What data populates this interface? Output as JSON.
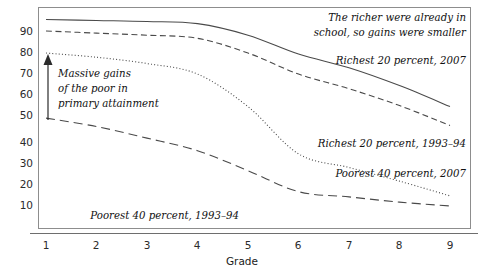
{
  "chart_data": {
    "type": "line",
    "title": "",
    "xlabel": "Grade",
    "ylabel": "",
    "x": [
      1,
      2,
      3,
      4,
      5,
      6,
      7,
      8,
      9
    ],
    "xlim": [
      0.6,
      9.4
    ],
    "ylim": [
      0,
      100
    ],
    "xticks": [
      "1",
      "2",
      "3",
      "4",
      "5",
      "6",
      "7",
      "8",
      "9"
    ],
    "yticks": [
      "10",
      "20",
      "30",
      "40",
      "50",
      "60",
      "70",
      "80",
      "90"
    ],
    "ytick_values": [
      10,
      20,
      30,
      40,
      50,
      60,
      70,
      80,
      90
    ],
    "grid": false,
    "legend_position": "inline-right",
    "series": [
      {
        "name": "Richest 20 percent, 2007",
        "style": "solid",
        "values": [
          95.5,
          95.0,
          94.5,
          93.5,
          88.0,
          79.0,
          72.5,
          64.0,
          54.0
        ]
      },
      {
        "name": "Richest 20 percent, 1993–94",
        "style": "dashed",
        "values": [
          90.0,
          89.0,
          88.0,
          86.5,
          79.5,
          69.5,
          62.5,
          54.5,
          45.0
        ]
      },
      {
        "name": "Poorest 40 percent, 2007",
        "style": "dotted",
        "values": [
          79.5,
          77.5,
          74.5,
          69.5,
          54.0,
          31.5,
          25.0,
          18.5,
          11.5
        ]
      },
      {
        "name": "Poorest 40 percent, 1993–94",
        "style": "long-dash",
        "values": [
          48.5,
          44.5,
          39.0,
          33.0,
          23.5,
          13.5,
          11.0,
          8.5,
          6.7
        ]
      }
    ],
    "annotations": [
      {
        "name": "richer-note",
        "lines": [
          "The richer were already in",
          "school, so gains were smaller"
        ]
      },
      {
        "name": "massive-gains-note",
        "lines": [
          "Massive gains",
          "of the poor in",
          "primary attainment"
        ]
      }
    ]
  },
  "labels": {
    "series_richest_2007": "Richest 20 percent, 2007",
    "series_richest_1993": "Richest 20 percent, 1993–94",
    "series_poorest_2007": "Poorest 40 percent, 2007",
    "series_poorest_1993": "Poorest 40 percent, 1993–94",
    "note_line1": "The richer were already in",
    "note_line2": "school, so gains were smaller",
    "callout_line1": "Massive gains",
    "callout_line2": "of the poor in",
    "callout_line3": "primary attainment",
    "x_axis_title": "Grade"
  },
  "ticks": {
    "y": [
      "90",
      "80",
      "70",
      "60",
      "50",
      "40",
      "30",
      "20",
      "10"
    ],
    "x": [
      "1",
      "2",
      "3",
      "4",
      "5",
      "6",
      "7",
      "8",
      "9"
    ]
  },
  "colors": {
    "line": "#4a4a4a",
    "frame": "#8d8d8d",
    "text": "#111111",
    "background": "#ffffff"
  }
}
